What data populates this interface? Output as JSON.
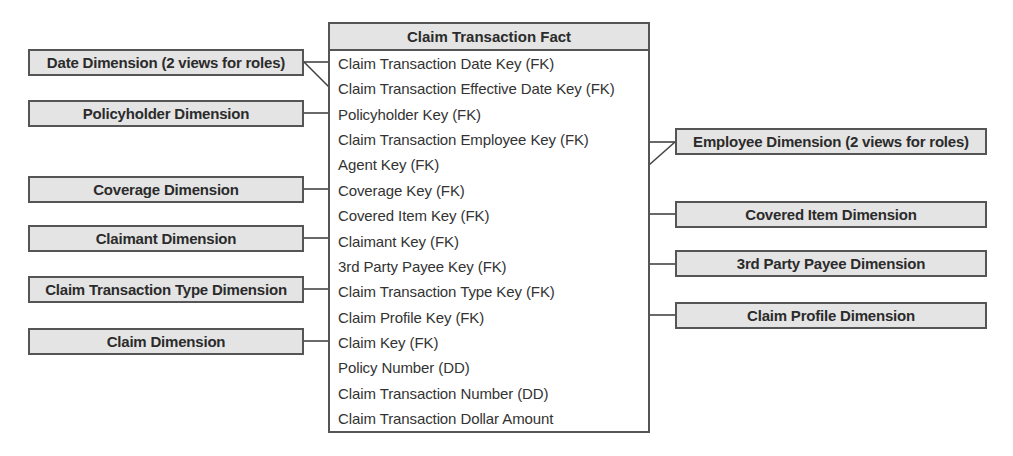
{
  "fact_table": {
    "title": "Claim Transaction Fact",
    "columns": [
      "Claim Transaction Date Key (FK)",
      "Claim Transaction Effective Date Key (FK)",
      "Policyholder Key (FK)",
      "Claim Transaction Employee Key (FK)",
      "Agent Key (FK)",
      "Coverage Key (FK)",
      "Covered Item Key (FK)",
      "Claimant Key (FK)",
      "3rd Party Payee Key (FK)",
      "Claim Transaction Type Key (FK)",
      "Claim Profile Key (FK)",
      "Claim Key (FK)",
      "Policy Number (DD)",
      "Claim Transaction Number (DD)",
      "Claim Transaction Dollar Amount"
    ]
  },
  "left_dimensions": [
    {
      "label": "Date Dimension (2 views for roles)",
      "connects_to": [
        "Claim Transaction Date Key (FK)",
        "Claim Transaction Effective Date Key (FK)"
      ]
    },
    {
      "label": "Policyholder Dimension",
      "connects_to": [
        "Policyholder Key (FK)"
      ]
    },
    {
      "label": "Coverage Dimension",
      "connects_to": [
        "Coverage Key (FK)"
      ]
    },
    {
      "label": "Claimant Dimension",
      "connects_to": [
        "Claimant Key (FK)"
      ]
    },
    {
      "label": "Claim Transaction Type Dimension",
      "connects_to": [
        "Claim Transaction Type Key (FK)"
      ]
    },
    {
      "label": "Claim Dimension",
      "connects_to": [
        "Claim Key (FK)"
      ]
    }
  ],
  "right_dimensions": [
    {
      "label": "Employee Dimension (2 views for roles)",
      "connects_to": [
        "Claim Transaction Employee Key (FK)",
        "Agent Key (FK)"
      ]
    },
    {
      "label": "Covered Item Dimension",
      "connects_to": [
        "Covered Item Key (FK)"
      ]
    },
    {
      "label": "3rd Party Payee Dimension",
      "connects_to": [
        "3rd Party Payee Key (FK)"
      ]
    },
    {
      "label": "Claim Profile Dimension",
      "connects_to": [
        "Claim Profile Key (FK)"
      ]
    }
  ],
  "colors": {
    "box_fill": "#e4e4e4",
    "border": "#555555",
    "text": "#2b2b2b"
  }
}
